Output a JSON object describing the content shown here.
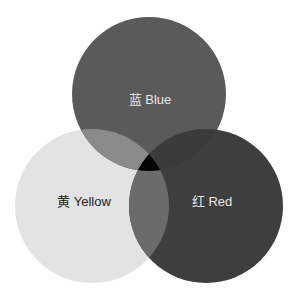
{
  "diagram": {
    "type": "venn",
    "sets": [
      {
        "id": "blue",
        "label": "蓝 Blue",
        "cx": 149,
        "cy": 94,
        "r": 77,
        "fill": "#5a5a5a",
        "label_color": "#e6e6e6",
        "label_x": 150,
        "label_y": 104
      },
      {
        "id": "yellow",
        "label": "黄 Yellow",
        "cx": 92,
        "cy": 206,
        "r": 77,
        "fill": "#e3e3e3",
        "label_color": "#222222",
        "label_x": 84,
        "label_y": 206
      },
      {
        "id": "red",
        "label": "红 Red",
        "cx": 206,
        "cy": 206,
        "r": 77,
        "fill": "#3e3e3e",
        "label_color": "#e6e6e6",
        "label_x": 212,
        "label_y": 206
      }
    ],
    "intersections": {
      "blue_yellow": "#8a8a8a",
      "red_yellow": "#6b6b6b",
      "blue_red": "#3b3b3b",
      "all": "#050505"
    }
  },
  "top_fragment": "— — — — — — — — — — —"
}
